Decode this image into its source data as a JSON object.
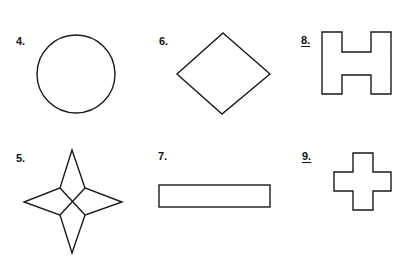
{
  "figures": [
    {
      "id": "4",
      "label": "4.",
      "shape": "circle",
      "underlined": false
    },
    {
      "id": "6",
      "label": "6.",
      "shape": "diamond",
      "underlined": false
    },
    {
      "id": "8",
      "label": "8.",
      "shape": "h-shape",
      "underlined": true
    },
    {
      "id": "5",
      "label": "5.",
      "shape": "four-pointed-star",
      "underlined": false
    },
    {
      "id": "7",
      "label": "7.",
      "shape": "rectangle",
      "underlined": false
    },
    {
      "id": "9",
      "label": "9.",
      "shape": "plus-cross",
      "underlined": true
    }
  ],
  "colors": {
    "stroke": "#1a1a1a",
    "background": "#ffffff",
    "text": "#111111"
  }
}
